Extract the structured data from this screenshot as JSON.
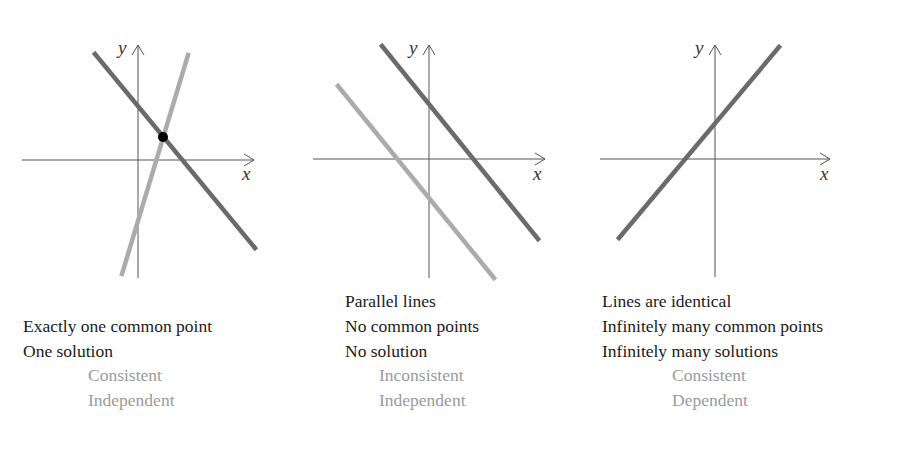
{
  "panels": [
    {
      "id": "intersecting",
      "axis_x_label": "x",
      "axis_y_label": "y",
      "captions": [
        "",
        "Exactly one common point",
        "One solution"
      ],
      "classification": [
        "Consistent",
        "Independent"
      ]
    },
    {
      "id": "parallel",
      "axis_x_label": "x",
      "axis_y_label": "y",
      "captions": [
        "Parallel lines",
        "No common points",
        "No solution"
      ],
      "classification": [
        "Inconsistent",
        "Independent"
      ]
    },
    {
      "id": "identical",
      "axis_x_label": "x",
      "axis_y_label": "y",
      "captions": [
        "Lines are identical",
        "Infinitely many common points",
        "Infinitely many solutions"
      ],
      "classification": [
        "Consistent",
        "Dependent"
      ]
    }
  ],
  "colors": {
    "dark_line": "#6b6b6b",
    "light_line": "#ababab",
    "axis": "#555555",
    "point": "#000000",
    "caption_text": "#1a1a1a",
    "classification_text": "#9a9a9a"
  }
}
